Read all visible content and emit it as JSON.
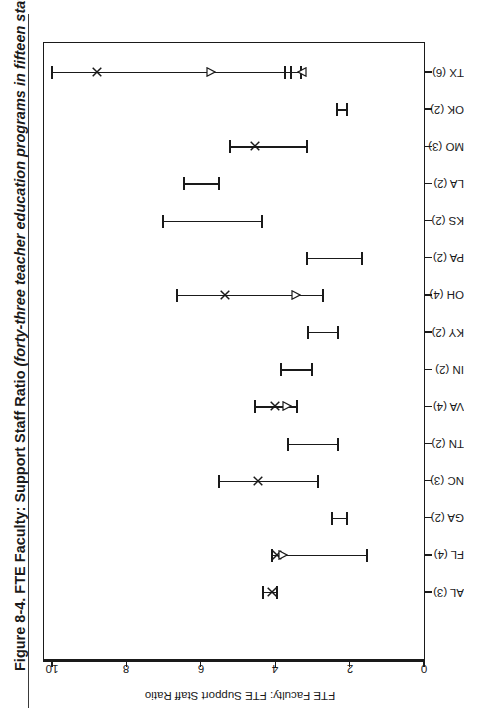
{
  "figure": {
    "number": "Figure 8-4.",
    "title": "FTE Faculty: Support Staff Ratio",
    "subtitle": "(forty-three teacher education programs in fifteen states)."
  },
  "chart_data": {
    "type": "scatter",
    "title": "FTE Faculty: Support Staff Ratio (forty-three teacher education programs in fifteen states).",
    "orientation": "horizontal-rotated-90ccw",
    "xlabel": "FTE Faculty: FTE Support Staff Ratio",
    "ylabel": "States and Number of Universities",
    "xlim": [
      10,
      0
    ],
    "x_reversed": true,
    "xticks": [
      10,
      8,
      6,
      4,
      2,
      0
    ],
    "xtick_labels": [
      "10",
      "8",
      "6",
      "4",
      "2",
      "0"
    ],
    "grid": false,
    "legend": "none",
    "categories": [
      "TX (6)",
      "OK (2)",
      "MO (3)",
      "LA (2)",
      "KS (2)",
      "PA (2)",
      "OH (4)",
      "KY (2)",
      "IN (2)",
      "VA (4)",
      "TN (2)",
      "NC (3)",
      "GA (2)",
      "FL (4)",
      "AL (3)"
    ],
    "ranges": [
      {
        "category": "TX (6)",
        "universities": 6,
        "low": 3.3,
        "high": 10.0,
        "markers": [
          {
            "shape": "x",
            "value": 8.8
          },
          {
            "shape": "triangle-right",
            "value": 5.72
          },
          {
            "shape": "tick",
            "value": 3.74
          },
          {
            "shape": "tick",
            "value": 3.58
          },
          {
            "shape": "triangle-left",
            "value": 3.28
          }
        ]
      },
      {
        "category": "OK (2)",
        "universities": 2,
        "low": 2.07,
        "high": 2.34,
        "markers": []
      },
      {
        "category": "MO (3)",
        "universities": 3,
        "low": 3.15,
        "high": 5.22,
        "markers": [
          {
            "shape": "x",
            "value": 4.54
          }
        ]
      },
      {
        "category": "LA (2)",
        "universities": 2,
        "low": 5.51,
        "high": 6.45,
        "markers": []
      },
      {
        "category": "KS (2)",
        "universities": 2,
        "low": 4.35,
        "high": 7.02,
        "markers": []
      },
      {
        "category": "PA (2)",
        "universities": 2,
        "low": 1.67,
        "high": 3.15,
        "markers": []
      },
      {
        "category": "OH (4)",
        "universities": 4,
        "low": 2.72,
        "high": 6.64,
        "markers": [
          {
            "shape": "x",
            "value": 5.35
          },
          {
            "shape": "triangle-right",
            "value": 3.44
          }
        ]
      },
      {
        "category": "KY (2)",
        "universities": 2,
        "low": 2.31,
        "high": 3.12,
        "markers": []
      },
      {
        "category": "IN (2)",
        "universities": 2,
        "low": 3.01,
        "high": 3.85,
        "markers": []
      },
      {
        "category": "VA (4)",
        "universities": 4,
        "low": 3.41,
        "high": 4.54,
        "markers": [
          {
            "shape": "x",
            "value": 4.01
          },
          {
            "shape": "triangle-right",
            "value": 3.68
          }
        ]
      },
      {
        "category": "TN (2)",
        "universities": 2,
        "low": 2.31,
        "high": 3.66,
        "markers": []
      },
      {
        "category": "NC (3)",
        "universities": 3,
        "low": 2.85,
        "high": 5.51,
        "markers": [
          {
            "shape": "x",
            "value": 4.46
          }
        ]
      },
      {
        "category": "GA (2)",
        "universities": 2,
        "low": 2.07,
        "high": 2.47,
        "markers": []
      },
      {
        "category": "FL (4)",
        "universities": 4,
        "low": 1.53,
        "high": 4.09,
        "markers": [
          {
            "shape": "x",
            "value": 3.95
          },
          {
            "shape": "triangle-right",
            "value": 3.79
          }
        ]
      },
      {
        "category": "AL (3)",
        "universities": 3,
        "low": 3.95,
        "high": 4.33,
        "markers": [
          {
            "shape": "x",
            "value": 4.09
          }
        ]
      }
    ]
  }
}
